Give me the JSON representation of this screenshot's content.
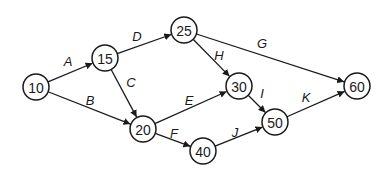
{
  "diagram": {
    "type": "activity-network",
    "nodes": [
      {
        "id": "10",
        "label": "10",
        "x": 36,
        "y": 87
      },
      {
        "id": "15",
        "label": "15",
        "x": 105,
        "y": 58
      },
      {
        "id": "25",
        "label": "25",
        "x": 184,
        "y": 30
      },
      {
        "id": "20",
        "label": "20",
        "x": 143,
        "y": 129
      },
      {
        "id": "30",
        "label": "30",
        "x": 239,
        "y": 86
      },
      {
        "id": "40",
        "label": "40",
        "x": 203,
        "y": 151
      },
      {
        "id": "50",
        "label": "50",
        "x": 275,
        "y": 122
      },
      {
        "id": "60",
        "label": "60",
        "x": 357,
        "y": 86
      }
    ],
    "edges": [
      {
        "label": "A",
        "from": "10",
        "to": "15",
        "lx": 68,
        "ly": 61
      },
      {
        "label": "B",
        "from": "10",
        "to": "20",
        "lx": 90,
        "ly": 100
      },
      {
        "label": "C",
        "from": "15",
        "to": "20",
        "lx": 131,
        "ly": 82
      },
      {
        "label": "D",
        "from": "15",
        "to": "25",
        "lx": 137,
        "ly": 36
      },
      {
        "label": "E",
        "from": "20",
        "to": "30",
        "lx": 189,
        "ly": 100
      },
      {
        "label": "F",
        "from": "20",
        "to": "40",
        "lx": 174,
        "ly": 133
      },
      {
        "label": "G",
        "from": "25",
        "to": "60",
        "lx": 262,
        "ly": 43
      },
      {
        "label": "H",
        "from": "25",
        "to": "30",
        "lx": 219,
        "ly": 55
      },
      {
        "label": "I",
        "from": "30",
        "to": "50",
        "lx": 262,
        "ly": 93
      },
      {
        "label": "J",
        "from": "40",
        "to": "50",
        "lx": 235,
        "ly": 132
      },
      {
        "label": "K",
        "from": "50",
        "to": "60",
        "lx": 306,
        "ly": 97
      }
    ],
    "node_radius": 13
  }
}
